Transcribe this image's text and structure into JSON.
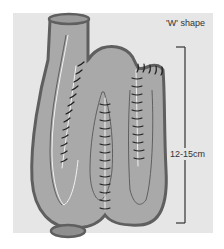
{
  "diagram": {
    "title": "'W' shape",
    "measurement_label": "12-15cm",
    "colors": {
      "background_panel": "#e6e6e6",
      "pouch_fill": "#a9a9a9",
      "pouch_outline": "#5f5f5f",
      "suture": "#1f1f1f",
      "suture_line": "#f2f2f2",
      "bracket": "#333333"
    }
  }
}
